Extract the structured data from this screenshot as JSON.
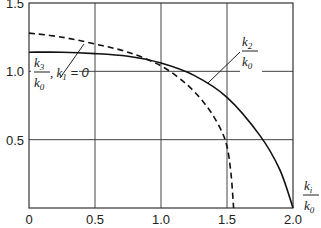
{
  "chart_data": {
    "type": "line",
    "title": "",
    "xlabel": "k_i / k_0",
    "ylabel": "",
    "xlim": [
      0,
      2.0
    ],
    "ylim": [
      0,
      1.5
    ],
    "grid": true,
    "x_ticks": [
      "0",
      "0.5",
      "1.0",
      "1.5",
      "2.0"
    ],
    "y_ticks": [
      "0.5",
      "1.0",
      "1.5"
    ],
    "series": [
      {
        "name": "k2/k0",
        "style": "solid",
        "x": [
          0,
          0.25,
          0.5,
          0.75,
          1.0,
          1.25,
          1.5,
          1.75,
          1.9,
          2.0
        ],
        "y": [
          1.14,
          1.14,
          1.13,
          1.11,
          1.06,
          0.97,
          0.81,
          0.53,
          0.28,
          0.0
        ]
      },
      {
        "name": "k3/k0, k1 = 0",
        "style": "dashed",
        "x": [
          0,
          0.25,
          0.5,
          0.75,
          1.0,
          1.2,
          1.35,
          1.45,
          1.5,
          1.53,
          1.55
        ],
        "y": [
          1.28,
          1.25,
          1.2,
          1.14,
          1.04,
          0.9,
          0.74,
          0.58,
          0.45,
          0.25,
          0.0
        ]
      }
    ],
    "annotations": [
      {
        "text_num": "k",
        "text_num_sub": "2",
        "text_den": "k",
        "text_den_sub": "0",
        "target": "solid curve"
      },
      {
        "text_num": "k",
        "text_num_sub": "3",
        "text_den": "k",
        "text_den_sub": "0",
        "suffix": ", k",
        "suffix_sub": "1",
        "suffix_tail": " = 0",
        "target": "dashed curve"
      }
    ],
    "axis_label": {
      "num": "k",
      "num_sub": "i",
      "den": "k",
      "den_sub": "0"
    }
  }
}
